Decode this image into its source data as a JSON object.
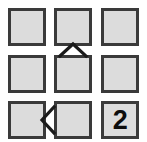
{
  "diagram": {
    "type": "grid-with-direction-markers",
    "rows": 3,
    "columns": 3,
    "background_color": "#ffffff",
    "cell_fill_color": "#dcdcdc",
    "cell_border_color": "#3a3a3a",
    "marker_color": "#1a1a1a",
    "cells": [
      {
        "row": 0,
        "col": 0,
        "label": "",
        "name": "cell-r0-c0"
      },
      {
        "row": 0,
        "col": 1,
        "label": "",
        "name": "cell-r0-c1"
      },
      {
        "row": 0,
        "col": 2,
        "label": "",
        "name": "cell-r0-c2"
      },
      {
        "row": 1,
        "col": 0,
        "label": "",
        "name": "cell-r1-c0"
      },
      {
        "row": 1,
        "col": 1,
        "label": "",
        "name": "cell-r1-c1"
      },
      {
        "row": 1,
        "col": 2,
        "label": "",
        "name": "cell-r1-c2"
      },
      {
        "row": 2,
        "col": 0,
        "label": "",
        "name": "cell-r2-c0"
      },
      {
        "row": 2,
        "col": 1,
        "label": "",
        "name": "cell-r2-c1"
      },
      {
        "row": 2,
        "col": 2,
        "label": "2",
        "name": "cell-r2-c2"
      }
    ],
    "markers": [
      {
        "icon": "chevron-up-icon",
        "glyph": "^",
        "direction": "up",
        "between": "row0-col1 and row1-col1"
      },
      {
        "icon": "chevron-left-icon",
        "glyph": "<",
        "direction": "left",
        "between": "row2-col0 and row2-col1"
      }
    ]
  }
}
